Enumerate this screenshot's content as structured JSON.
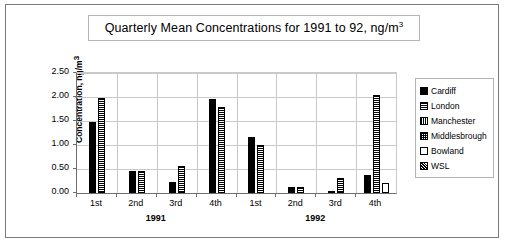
{
  "chart_data": {
    "type": "bar",
    "title_main": "Quarterly Mean Concentrations for 1991 to 92, ng/m",
    "title_sup": "3",
    "xlabel": "",
    "ylabel": "Concentration, ng/m",
    "ylabel_sup": "3",
    "ylim": [
      0,
      2.5
    ],
    "ytick_values": [
      0.0,
      0.5,
      1.0,
      1.5,
      2.0,
      2.5
    ],
    "ytick_labels": [
      "0.00",
      "0.50",
      "1.00",
      "1.50",
      "2.00",
      "2.50"
    ],
    "grid": true,
    "legend_position": "right",
    "categories": [
      "1st",
      "2nd",
      "3rd",
      "4th",
      "1st",
      "2nd",
      "3rd",
      "4th"
    ],
    "group_labels": [
      "1991",
      "1992"
    ],
    "series": [
      {
        "name": "Cardiff",
        "pattern": "solid",
        "values": [
          1.47,
          0.45,
          0.22,
          1.95,
          1.17,
          0.13,
          0.04,
          0.38
        ]
      },
      {
        "name": "London",
        "pattern": "horizontal-lines",
        "values": [
          1.97,
          0.45,
          0.56,
          1.8,
          1.0,
          0.13,
          0.32,
          2.05
        ]
      },
      {
        "name": "Manchester",
        "pattern": "vertical-lines",
        "values": [
          null,
          null,
          null,
          null,
          null,
          null,
          null,
          null
        ]
      },
      {
        "name": "Middlesbrough",
        "pattern": "crosshatch",
        "values": [
          null,
          null,
          null,
          null,
          null,
          null,
          null,
          null
        ]
      },
      {
        "name": "Bowland",
        "pattern": "empty",
        "values": [
          null,
          null,
          null,
          null,
          null,
          null,
          null,
          0.2
        ]
      },
      {
        "name": "WSL",
        "pattern": "dots",
        "values": [
          null,
          null,
          null,
          null,
          null,
          null,
          null,
          null
        ]
      }
    ]
  },
  "legend": {
    "items": [
      {
        "label": "Cardiff",
        "pattern": "solid"
      },
      {
        "label": "London",
        "pattern": "horizontal-lines"
      },
      {
        "label": "Manchester",
        "pattern": "vertical-lines"
      },
      {
        "label": "Middlesbrough",
        "pattern": "crosshatch"
      },
      {
        "label": "Bowland",
        "pattern": "empty"
      },
      {
        "label": "WSL",
        "pattern": "dots"
      }
    ]
  },
  "colors": {
    "frame_border": "#7a7a7a",
    "axis": "#6e6e6e",
    "gridline": "#c9c9c9",
    "bar_fill": "#000000",
    "background": "#ffffff"
  }
}
